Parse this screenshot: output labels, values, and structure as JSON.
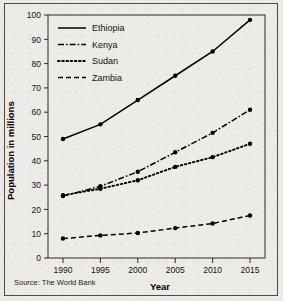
{
  "chart_data": {
    "type": "line",
    "title": "",
    "xlabel": "Year",
    "ylabel": "Population in millions",
    "x": [
      1990,
      1995,
      2000,
      2005,
      2010,
      2015
    ],
    "xtick_labels": [
      "1990",
      "1995",
      "2000",
      "2005",
      "2010",
      "2015"
    ],
    "ytick_labels": [
      "0",
      "10",
      "20",
      "30",
      "40",
      "50",
      "60",
      "70",
      "80",
      "90",
      "100"
    ],
    "yticks": [
      0,
      10,
      20,
      30,
      40,
      50,
      60,
      70,
      80,
      90,
      100
    ],
    "xlim": [
      1988,
      2017
    ],
    "ylim": [
      0,
      100
    ],
    "grid": false,
    "legend_position": "top-left inside",
    "series": [
      {
        "name": "Ethiopia",
        "style": "solid",
        "dash": "none",
        "values": [
          49,
          55,
          65,
          75,
          85,
          98
        ]
      },
      {
        "name": "Kenya",
        "style": "dash-dot",
        "dash": "6,2,1.6,2",
        "values": [
          25.5,
          29.5,
          35.5,
          43.5,
          51.5,
          61
        ]
      },
      {
        "name": "Sudan",
        "style": "dotted",
        "dash": "1.6,2.6",
        "values": [
          25.8,
          28.5,
          32,
          37.5,
          41.5,
          47
        ]
      },
      {
        "name": "Zambia",
        "style": "dashed",
        "dash": "5,3",
        "values": [
          8,
          9.3,
          10.3,
          12.3,
          14.2,
          17.5
        ]
      }
    ],
    "annotations": [
      "Source: The World Bank"
    ]
  },
  "axes": {
    "y_title": "Population in millions",
    "x_title": "Year"
  },
  "legend": {
    "entries": [
      {
        "label": "Ethiopia"
      },
      {
        "label": "Kenya"
      },
      {
        "label": "Sudan"
      },
      {
        "label": "Zambia"
      }
    ]
  },
  "footer": {
    "source": "Source: The World Bank"
  },
  "colors": {
    "ink": "#000000",
    "axis": "#2a2a2a",
    "paper": "#edebe7",
    "frame": "#4a4a4a"
  }
}
